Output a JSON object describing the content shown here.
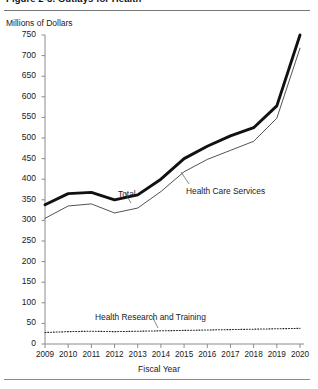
{
  "figure": {
    "title": "Figure 2-3.  Outlays for Health",
    "y_axis_caption": "Millions of Dollars",
    "x_axis_caption": "Fiscal Year"
  },
  "chart_data": {
    "type": "line",
    "title": "Figure 2-3.  Outlays for Health",
    "xlabel": "Fiscal Year",
    "ylabel": "Millions of Dollars",
    "x": [
      2009,
      2010,
      2011,
      2012,
      2013,
      2014,
      2015,
      2016,
      2017,
      2018,
      2019,
      2020
    ],
    "categories": [
      "2009",
      "2010",
      "2011",
      "2012",
      "2013",
      "2014",
      "2015",
      "2016",
      "2017",
      "2018",
      "2019",
      "2020"
    ],
    "xlim": [
      2009,
      2020
    ],
    "ylim": [
      0,
      750
    ],
    "ytick_values": [
      0,
      50,
      100,
      150,
      200,
      250,
      300,
      350,
      400,
      450,
      500,
      550,
      600,
      650,
      700,
      750
    ],
    "ytick_labels": [
      "0",
      "50",
      "100",
      "150",
      "200",
      "250",
      "300",
      "350",
      "400",
      "450",
      "500",
      "550",
      "600",
      "650",
      "700",
      "750"
    ],
    "grid": false,
    "legend_position": "inline-annotations",
    "series": [
      {
        "name": "Total",
        "style": "thick-solid",
        "color": "#111111",
        "values": [
          338,
          365,
          368,
          350,
          362,
          400,
          450,
          480,
          505,
          525,
          578,
          750
        ]
      },
      {
        "name": "Health Care Services",
        "style": "thin-solid",
        "color": "#333333",
        "values": [
          305,
          335,
          340,
          318,
          330,
          370,
          418,
          448,
          470,
          492,
          548,
          718
        ]
      },
      {
        "name": "Health Research and Training",
        "style": "dotted",
        "color": "#222222",
        "values": [
          28,
          30,
          31,
          30,
          31,
          32,
          33,
          34,
          35,
          36,
          37,
          38
        ]
      }
    ],
    "annotations": [
      {
        "text": "Total",
        "series": "Total",
        "x_px": 118,
        "y_px": 189
      },
      {
        "text": "Health Care Services",
        "series": "Health Care Services",
        "x_px": 186,
        "y_px": 186
      },
      {
        "text": "Health Research and Training",
        "series": "Health Research and Training",
        "x_px": 95,
        "y_px": 312
      }
    ]
  }
}
